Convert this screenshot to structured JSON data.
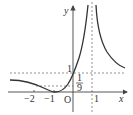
{
  "diagram": {
    "type": "function-graph",
    "axes": {
      "x_label": "x",
      "y_label": "y",
      "origin_label": "O"
    },
    "x_ticks": [
      {
        "value": -2,
        "label": "−2"
      },
      {
        "value": -1,
        "label": "−1"
      },
      {
        "value": 1,
        "label": "1"
      }
    ],
    "y_ticks": [
      {
        "value": 1,
        "label": "1"
      },
      {
        "value": 0.1111,
        "label_num": "1",
        "label_den": "9"
      }
    ],
    "asymptote": {
      "x": 1,
      "style": "dashed"
    },
    "reference_lines": [
      {
        "y": 1,
        "style": "dashed"
      },
      {
        "y": 0.1111,
        "style": "dashed"
      }
    ],
    "colors": {
      "curve": "#333333",
      "axis": "#444444",
      "dashed": "#777777"
    }
  }
}
